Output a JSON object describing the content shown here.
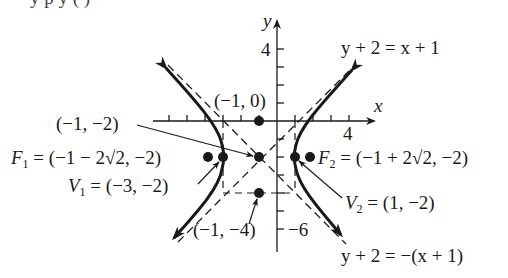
{
  "figure": {
    "top_fragment": "y   p      y            (         )",
    "axes": {
      "x_label": "x",
      "y_label": "y",
      "x_tick_label": "4",
      "y_tick_label_top": "4",
      "y_tick_label_bottom": "−6"
    },
    "asymptotes": {
      "positive": "y + 2 = x + 1",
      "negative": "y + 2 = −(x + 1)"
    },
    "points": {
      "top": "(−1, 0)",
      "center": "(−1, −2)",
      "bottom": "(−1, −4)",
      "f1_name": "F",
      "f1_sub": "1",
      "f1_value": " = (−1 − 2√2, −2)",
      "f2_name": "F",
      "f2_sub": "2",
      "f2_value": " = (−1 + 2√2, −2)",
      "v1_name": "V",
      "v1_sub": "1",
      "v1_value": " = (−3, −2)",
      "v2_name": "V",
      "v2_sub": "2",
      "v2_value": " = (1, −2)"
    },
    "hyperbola": {
      "equation": "(x + 1)^2/4 − (y + 2)^2/4 = 1",
      "center": [
        -1,
        -2
      ],
      "a": 2,
      "b": 2
    },
    "colors": {
      "ink": "#1a1a1a",
      "background": "#ffffff"
    }
  }
}
